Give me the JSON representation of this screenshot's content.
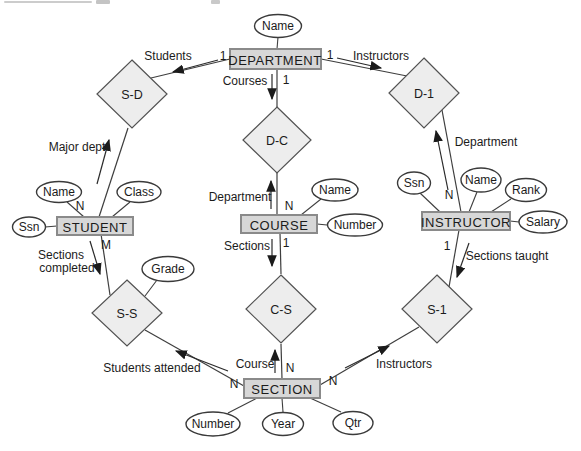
{
  "diagram": {
    "type": "er-diagram",
    "entities": {
      "department": "DEPARTMENT",
      "student": "STUDENT",
      "course": "COURSE",
      "instructor": "INSTRUCTOR",
      "section": "SECTION"
    },
    "relationships": {
      "s_d": "S-D",
      "d_1": "D-1",
      "d_c": "D-C",
      "s_s": "S-S",
      "c_s": "C-S",
      "s_1": "S-1"
    },
    "attributes": {
      "department_name": "Name",
      "student_name": "Name",
      "student_class": "Class",
      "student_ssn": "Ssn",
      "course_name": "Name",
      "course_number": "Number",
      "instructor_ssn": "Ssn",
      "instructor_name": "Name",
      "instructor_rank": "Rank",
      "instructor_salary": "Salary",
      "grade": "Grade",
      "section_number": "Number",
      "section_year": "Year",
      "section_qtr": "Qtr"
    },
    "edge_labels": {
      "students": "Students",
      "instructors_top": "Instructors",
      "courses": "Courses",
      "major_dept": "Major dept",
      "department_right": "Department",
      "department_center": "Department",
      "sections_center": "Sections",
      "sections_completed_line1": "Sections",
      "sections_completed_line2": "completed",
      "sections_taught": "Sections taught",
      "students_attended": "Students attended",
      "course_bottom": "Course",
      "instructors_bottom": "Instructors"
    },
    "cardinalities": {
      "department_sd": "1",
      "department_d1": "1",
      "department_dc": "1",
      "student_sd": "N",
      "student_ss": "M",
      "course_dc": "N",
      "course_cs": "1",
      "instructor_d1": "N",
      "instructor_s1": "1",
      "section_ss": "N",
      "section_cs": "N",
      "section_s1": "N"
    },
    "colors": {
      "entity_fill": "#d7d7d7",
      "entity_border": "#8a8a8a",
      "diamond_fill": "#ededed",
      "diamond_border": "#525252",
      "oval_fill": "#ffffff",
      "oval_border": "#3a3a3a",
      "line": "#3e3e3e",
      "text": "#1b1b1b",
      "background": "#ffffff"
    }
  }
}
